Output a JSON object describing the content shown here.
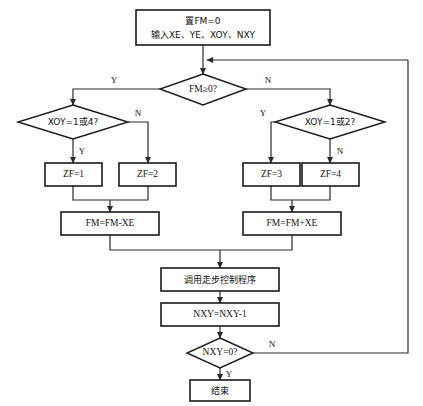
{
  "diagram": {
    "colors": {
      "stroke": "#1a1a1a",
      "connector": "#2b2b2b",
      "background": "#ffffff",
      "text": "#111111"
    },
    "nodes": {
      "start": {
        "type": "process",
        "line1": "置FM=0",
        "line2": "输入XE、YE、XOY、NXY"
      },
      "decision_fm": {
        "type": "decision",
        "label": "FM≥0?"
      },
      "decision_left": {
        "type": "decision",
        "label": "XOY=1或4?"
      },
      "decision_right": {
        "type": "decision",
        "label": "XOY=1或2?"
      },
      "zf1": {
        "type": "process",
        "label": "ZF=1"
      },
      "zf2": {
        "type": "process",
        "label": "ZF=2"
      },
      "zf3": {
        "type": "process",
        "label": "ZF=3"
      },
      "zf4": {
        "type": "process",
        "label": "ZF=4"
      },
      "fm_minus": {
        "type": "process",
        "label": "FM=FM-XE"
      },
      "fm_plus": {
        "type": "process",
        "label": "FM=FM+XE"
      },
      "call_sub": {
        "type": "process",
        "label": "调用走步控制程序"
      },
      "dec_nxy": {
        "type": "process",
        "label": "NXY=NXY-1"
      },
      "decision_nxy": {
        "type": "decision",
        "label": "NXY=0?"
      },
      "end": {
        "type": "terminal",
        "label": "结束"
      }
    },
    "branch_labels": {
      "fm_yes": "Y",
      "fm_no": "N",
      "left_yes": "Y",
      "left_no": "N",
      "right_yes": "Y",
      "right_no": "N",
      "nxy_no": "N",
      "nxy_yes": "Y"
    }
  }
}
